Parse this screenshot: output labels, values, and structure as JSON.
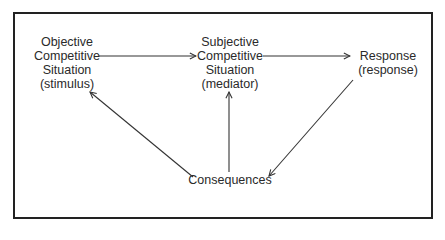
{
  "diagram": {
    "nodes": {
      "objective": {
        "lines": [
          "Objective",
          "Competitive",
          "Situation",
          "(stimulus)"
        ]
      },
      "subjective": {
        "lines": [
          "Subjective",
          "Competitive",
          "Situation",
          "(mediator)"
        ]
      },
      "response": {
        "lines": [
          "Response",
          "(response)"
        ]
      },
      "consequences": {
        "lines": [
          "Consequences"
        ]
      }
    },
    "edges": [
      {
        "from": "Objective Competitive Situation (stimulus)",
        "to": "Subjective Competitive Situation (mediator)"
      },
      {
        "from": "Subjective Competitive Situation (mediator)",
        "to": "Response (response)"
      },
      {
        "from": "Response (response)",
        "to": "Consequences"
      },
      {
        "from": "Consequences",
        "to": "Objective Competitive Situation (stimulus)"
      },
      {
        "from": "Consequences",
        "to": "Subjective Competitive Situation (mediator)"
      }
    ],
    "colors": {
      "line": "#333333",
      "text": "#2a2a2a",
      "border": "#222222",
      "background": "#ffffff"
    }
  }
}
